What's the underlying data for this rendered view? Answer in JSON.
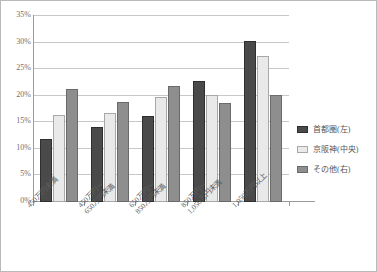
{
  "chart_data": {
    "type": "bar",
    "title": "",
    "xlabel": "",
    "ylabel": "",
    "ylim": [
      0,
      35
    ],
    "grid": true,
    "legend_position": "right",
    "y_ticks": [
      "0%",
      "5%",
      "10%",
      "15%",
      "20%",
      "25%",
      "30%",
      "35%"
    ],
    "y_tick_values": [
      0,
      5,
      10,
      15,
      20,
      25,
      30,
      35
    ],
    "categories": [
      "450万円未満",
      "450万円〜650万円未満",
      "650万円〜850万円未満",
      "850万円〜1,050万円未満",
      "1,050万円以上"
    ],
    "category_lines": [
      [
        "450万円未満",
        ""
      ],
      [
        "450万円〜",
        "650万円未満"
      ],
      [
        "650万円〜",
        "850万円未満"
      ],
      [
        "850万円〜",
        "1,050万円未満"
      ],
      [
        "1,050万円以上",
        ""
      ]
    ],
    "series": [
      {
        "name": "首都圏(左)",
        "color": "#4a4a4a",
        "values": [
          11.8,
          14.2,
          16.2,
          22.7,
          30.3
        ]
      },
      {
        "name": "京阪神(中央)",
        "color": "#e9e9e9",
        "values": [
          16.3,
          16.7,
          19.7,
          20.2,
          27.4
        ]
      },
      {
        "name": "その他(右)",
        "color": "#8e8e8e",
        "values": [
          21.2,
          18.8,
          21.8,
          18.6,
          20.2
        ]
      }
    ]
  },
  "legend": {
    "items": [
      {
        "label": "首都圏(左)",
        "swatch": "dark-swatch-icon"
      },
      {
        "label": "京阪神(中央)",
        "swatch": "light-swatch-icon"
      },
      {
        "label": "その他(右)",
        "swatch": "medium-swatch-icon"
      }
    ]
  }
}
